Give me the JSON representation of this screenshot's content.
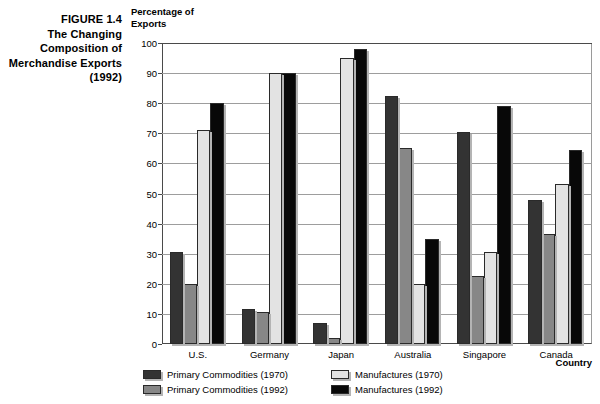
{
  "figure": {
    "caption_lines": [
      "FIGURE 1.4",
      "The Changing",
      "Composition of",
      "Merchandise Exports",
      "(1992)"
    ]
  },
  "axis": {
    "y_title_lines": [
      "Percentage of",
      "Exports"
    ],
    "x_title": "Country"
  },
  "colors": {
    "primary_1970": "#333333",
    "primary_1992": "#878787",
    "manufactures_1970": "#e3e3e3",
    "manufactures_1992": "#080808",
    "gridline": "#9d9d9d",
    "axis": "#4a4a4a",
    "shadow": "#b4b4b4",
    "background": "#ffffff"
  },
  "chart_data": {
    "type": "bar",
    "title": "FIGURE 1.4 The Changing Composition of Merchandise Exports (1992)",
    "xlabel": "Country",
    "ylabel": "Percentage of Exports",
    "ylim": [
      0,
      100
    ],
    "yticks": [
      0,
      10,
      20,
      30,
      40,
      50,
      60,
      70,
      80,
      90,
      100
    ],
    "grid": true,
    "legend_position": "bottom",
    "categories": [
      "U.S.",
      "Germany",
      "Japan",
      "Australia",
      "Singapore",
      "Canada"
    ],
    "series": [
      {
        "name": "Primary Commodities (1970)",
        "color": "#333333",
        "values": [
          30.5,
          11.5,
          7,
          82.5,
          70.5,
          48
        ]
      },
      {
        "name": "Primary Commodities (1992)",
        "color": "#878787",
        "values": [
          20,
          10.5,
          2,
          65,
          22.5,
          36.5
        ]
      },
      {
        "name": "Manufactures (1970)",
        "color": "#e3e3e3",
        "values": [
          71,
          90,
          95,
          20,
          30.5,
          53
        ]
      },
      {
        "name": "Manufactures (1992)",
        "color": "#080808",
        "values": [
          80,
          90,
          98,
          35,
          79,
          64.5
        ]
      }
    ]
  }
}
